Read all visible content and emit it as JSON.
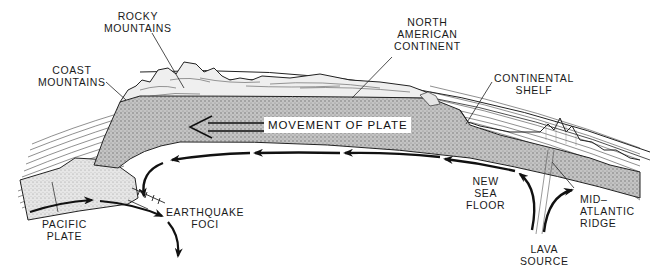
{
  "diagram": {
    "type": "cross-section",
    "colors": {
      "ink": "#1a1a1a",
      "plate_fill": "#b9b9b9",
      "pacific_fill": "#dcdcdc",
      "background": "#ffffff"
    },
    "labels": {
      "rocky_mountains": [
        "ROCKY",
        "MOUNTAINS"
      ],
      "coast_mountains": [
        "COAST",
        "MOUNTAINS"
      ],
      "north_american_continent": [
        "NORTH",
        "AMERICAN",
        "CONTINENT"
      ],
      "continental_shelf": [
        "CONTINENTAL",
        "SHELF"
      ],
      "movement_of_plate": "MOVEMENT OF PLATE",
      "new_sea_floor": [
        "NEW",
        "SEA",
        "FLOOR"
      ],
      "mid_atlantic_ridge": [
        "MID–",
        "ATLANTIC",
        "RIDGE"
      ],
      "lava_source": [
        "LAVA",
        "SOURCE"
      ],
      "earthquake_foci": [
        "EARTHQUAKE",
        "FOCI"
      ],
      "pacific_plate": [
        "PACIFIC",
        "PLATE"
      ]
    },
    "arrows": [
      {
        "name": "movement-of-plate",
        "direction": "left",
        "style": "hollow-double"
      },
      {
        "name": "mantle-flow",
        "direction": "left",
        "style": "dashed-solid"
      },
      {
        "name": "pacific-subduction",
        "direction": "right-down"
      },
      {
        "name": "lava-upwelling-left",
        "direction": "up-left"
      },
      {
        "name": "lava-upwelling-right",
        "direction": "up-right"
      }
    ]
  }
}
